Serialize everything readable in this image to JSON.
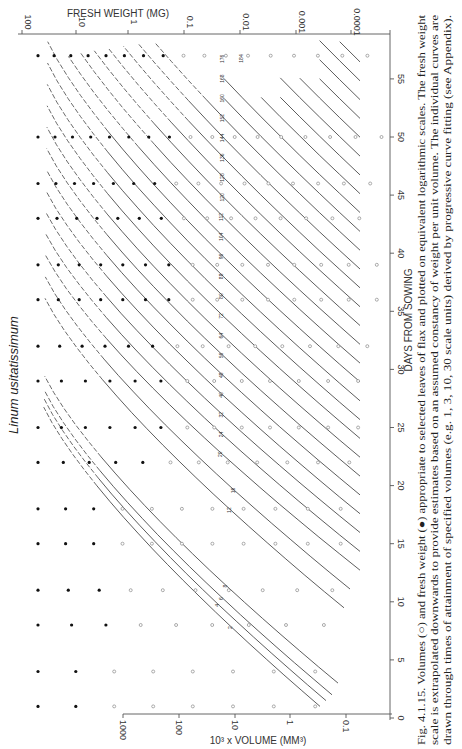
{
  "chart_data": {
    "type": "line",
    "orientation": "rotated 90° clockwise (page printed sideways)",
    "title": "Linum usitatissimum",
    "xlabel": "DAYS FROM SOWING",
    "x_ticks": [
      0,
      5,
      10,
      15,
      20,
      25,
      30,
      35,
      40,
      45,
      50,
      55
    ],
    "xlim": [
      0,
      57
    ],
    "ylabel_left": "10³ x VOLUME (MM³)",
    "y_left_ticks": [
      "1000",
      "100",
      "10",
      "1",
      "0.1"
    ],
    "y_left_scale": "log",
    "ylabel_top": "FRESH WEIGHT (MG)",
    "y_top_ticks": [
      "100",
      "10",
      "1",
      "0.1",
      "0.01",
      "0.001",
      "0.0001"
    ],
    "y_top_scale": "log",
    "legend": [
      {
        "marker": "open-circle",
        "meaning": "Volumes"
      },
      {
        "marker": "filled-circle",
        "meaning": "Fresh weight"
      }
    ],
    "curve_labels": [
      "2",
      "4",
      "6",
      "8",
      "12",
      "16",
      "20",
      "24",
      "32",
      "40",
      "48",
      "56",
      "64",
      "72",
      "80",
      "88",
      "96",
      "104",
      "112",
      "120",
      "128",
      "136",
      "144",
      "152",
      "160",
      "168",
      "176",
      "184",
      "192",
      "200",
      "208",
      "216",
      "232",
      "248"
    ],
    "sampling_days": [
      1,
      4,
      8,
      11,
      15,
      18,
      22,
      25,
      29,
      32,
      36,
      39,
      43,
      46,
      50,
      57
    ],
    "series_note": "Each curve is a leaf (numbered by node); solid segments = fitted growth, dashed = extrapolated near maturity/plateau"
  },
  "figure": {
    "title": "Linum usitatissimum",
    "top_axis_title": "FRESH WEIGHT (MG)",
    "top_ticks": [
      "100",
      "10",
      "1",
      "0.1",
      "0.01",
      "0.001",
      "0.0001"
    ],
    "bottom_axis_title": "10³ x VOLUME (MM³)",
    "bottom_ticks": [
      "1000",
      "100",
      "10",
      "1",
      "0.1"
    ],
    "days_axis_title": "DAYS FROM SOWING",
    "days_ticks": [
      "0",
      "5",
      "10",
      "15",
      "20",
      "25",
      "30",
      "35",
      "40",
      "45",
      "50",
      "55"
    ],
    "caption_lines": [
      "Fig. 4.1.15. Volumes (○) and fresh weight (●) appropriate to selected leaves of flax and plotted on equivalent logarithmic scales. The fresh weight",
      "scale is extrapolated downwards to provide estimates based on an assumed constancy of weight per unit volume. The individual curves are",
      "drawn through times of attainment of specified volumes (e.g. 1, 3, 10, 30 scale units) derived by progressive curve fitting (see Appendix)."
    ]
  }
}
